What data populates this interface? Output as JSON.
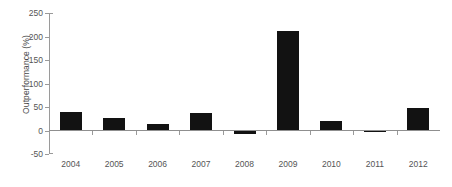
{
  "chart_data": {
    "type": "bar",
    "title": "",
    "xlabel": "",
    "ylabel": "Outperformance (%)",
    "categories": [
      "2004",
      "2005",
      "2006",
      "2007",
      "2008",
      "2009",
      "2010",
      "2011",
      "2012"
    ],
    "values": [
      39,
      26,
      13,
      38,
      -7,
      212,
      21,
      -1,
      47
    ],
    "series": [
      {
        "name": "Outperformance",
        "values": [
          39,
          26,
          13,
          38,
          -7,
          212,
          21,
          -1,
          47
        ],
        "color": "#121212"
      }
    ],
    "ylim": [
      -50,
      250
    ],
    "y_ticks": [
      250,
      200,
      150,
      100,
      50,
      0,
      -50
    ],
    "y_tick_labels": [
      "250",
      "200",
      "150",
      "100",
      "50",
      "0",
      "-50"
    ],
    "x_tick_labels": [
      "2004",
      "2005",
      "2006",
      "2007",
      "2008",
      "2009",
      "2010",
      "2011",
      "2012"
    ],
    "grid": false,
    "legend": null,
    "legend_position": "none",
    "bar_color": "#121212",
    "axis_color": "#9a9a9a",
    "text_color": "#555555",
    "background": "#ffffff",
    "annotations": []
  },
  "axes": {
    "y_title": "Outperformance (%)"
  }
}
